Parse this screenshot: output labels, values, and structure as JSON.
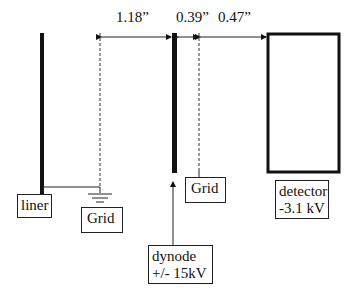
{
  "dimensions": {
    "liner_to_grid": "1.18”",
    "dynode_to_grid": "0.39”",
    "grid_to_detector": "0.47”"
  },
  "labels": {
    "liner": "liner",
    "grid_left": "Grid",
    "grid_right": "Grid",
    "dynode_line1": "dynode",
    "dynode_line2": "+/- 15kV",
    "detector_line1": "detector",
    "detector_line2": "-3.1 kV"
  },
  "colors": {
    "stroke": "#111111",
    "background": "#ffffff"
  }
}
